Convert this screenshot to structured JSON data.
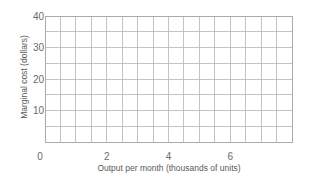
{
  "chart_data": {
    "type": "line",
    "title": "",
    "xlabel": "Output per month (thousands of units)",
    "ylabel": "Marginal cost (dollars)",
    "xlim": [
      0,
      8
    ],
    "ylim": [
      0,
      40
    ],
    "x_ticks": [
      0,
      2,
      4,
      6
    ],
    "x_tick_labels": [
      "0",
      "2",
      "4",
      "6"
    ],
    "y_ticks": [
      10,
      20,
      30,
      40
    ],
    "y_tick_labels": [
      "10",
      "20",
      "30",
      "40"
    ],
    "grid": true,
    "grid_x_step": 0.5,
    "grid_y_step": 5,
    "series": [],
    "legend": null,
    "note": "Blank grid — no data plotted"
  },
  "colors": {
    "grid": "#b4b4b4",
    "text": "#6a6a6a",
    "background": "#ffffff"
  },
  "layout": {
    "plot_left": 45,
    "plot_right": 292,
    "plot_top": 16,
    "plot_bottom": 142
  }
}
